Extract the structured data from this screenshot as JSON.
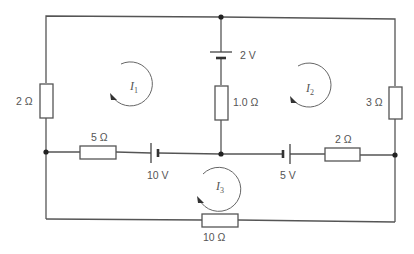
{
  "diagram": {
    "type": "circuit",
    "loop_currents": [
      {
        "id": "I1",
        "symbol": "I",
        "subscript": "1",
        "direction": "anticlockwise"
      },
      {
        "id": "I2",
        "symbol": "I",
        "subscript": "2",
        "direction": "anticlockwise"
      },
      {
        "id": "I3",
        "symbol": "I",
        "subscript": "3",
        "direction": "anticlockwise"
      }
    ],
    "components": {
      "r_left": {
        "label": "2 Ω",
        "type": "resistor"
      },
      "r_mid": {
        "label": "1.0 Ω",
        "type": "resistor"
      },
      "r_right": {
        "label": "3 Ω",
        "type": "resistor"
      },
      "r_5": {
        "label": "5 Ω",
        "type": "resistor"
      },
      "r_2b": {
        "label": "2 Ω",
        "type": "resistor"
      },
      "r_10": {
        "label": "10 Ω",
        "type": "resistor"
      },
      "b_2v": {
        "label": "2 V",
        "type": "battery"
      },
      "b_10v": {
        "label": "10 V",
        "type": "battery"
      },
      "b_5v": {
        "label": "5 V",
        "type": "battery"
      }
    },
    "colors": {
      "wire": "#555555",
      "node": "#222222",
      "text": "#555555",
      "background": "#ffffff"
    }
  }
}
